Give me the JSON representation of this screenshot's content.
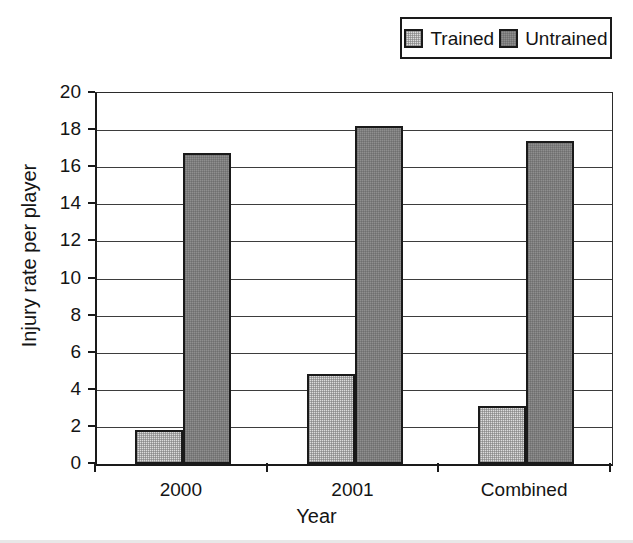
{
  "chart_data": {
    "type": "bar",
    "title": "",
    "xlabel": "Year",
    "ylabel": "Injury rate per player",
    "categories": [
      "2000",
      "2001",
      "Combined"
    ],
    "series": [
      {
        "name": "Trained",
        "values": [
          1.85,
          4.85,
          3.15
        ],
        "color": "#dcdcdc",
        "pattern": "fine-checker"
      },
      {
        "name": "Untrained",
        "values": [
          16.75,
          18.2,
          17.4
        ],
        "color": "#8f8f8f",
        "pattern": "fine-checker"
      }
    ],
    "ylim": [
      0,
      20
    ],
    "ytick_values": [
      0,
      2,
      4,
      6,
      8,
      10,
      12,
      14,
      16,
      18,
      20
    ],
    "ytick_labels": [
      "0",
      "2",
      "4",
      "6",
      "8",
      "10",
      "12",
      "14",
      "16",
      "18",
      "20"
    ],
    "grid": true,
    "grid_axis": "y",
    "legend_position": "top-right",
    "legend_border": true,
    "plot_border": true,
    "background_color": "#ffffff",
    "axis_color": "#1a1a1a"
  },
  "legend": {
    "entries": [
      {
        "label": "Trained"
      },
      {
        "label": "Untrained"
      }
    ]
  }
}
